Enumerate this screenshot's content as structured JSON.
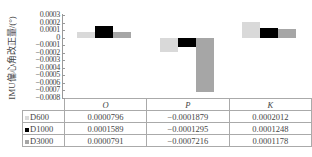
{
  "chart_data": {
    "type": "bar",
    "title": "",
    "xlabel": "",
    "ylabel": "IMU偏心角改正量/(°)",
    "categories": [
      "O",
      "P",
      "K"
    ],
    "series": [
      {
        "name": "D600",
        "color": "#d9d9d9",
        "values": [
          7.96e-05,
          -0.0001879,
          0.0002012
        ]
      },
      {
        "name": "D1000",
        "color": "#000000",
        "values": [
          0.0001589,
          -0.0001295,
          0.0001248
        ]
      },
      {
        "name": "D3000",
        "color": "#a6a6a6",
        "values": [
          7.91e-05,
          -0.0007216,
          0.0001178
        ]
      }
    ],
    "ylim": [
      -0.0008,
      0.0003
    ],
    "yticks": [
      "0.0003",
      "0.0002",
      "0.0001",
      "0",
      "-0.0001",
      "-0.0002",
      "-0.0003",
      "-0.0004",
      "-0.0005",
      "-0.0006",
      "-0.0007",
      "-0.0008"
    ],
    "grid": false,
    "legend_position": "data-table"
  },
  "table": {
    "headers": [
      "O",
      "P",
      "K"
    ],
    "rows": [
      {
        "label": "D600",
        "cells": [
          "0.0000796",
          "-0.0001879",
          "0.0002012"
        ]
      },
      {
        "label": "D1000",
        "cells": [
          "0.0001589",
          "-0.0001295",
          "0.0001248"
        ]
      },
      {
        "label": "D3000",
        "cells": [
          "0.0000791",
          "-0.0007216",
          "0.0001178"
        ]
      }
    ]
  }
}
